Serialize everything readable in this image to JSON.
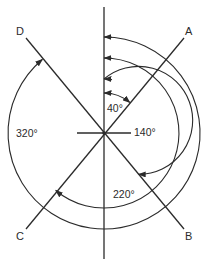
{
  "diagram": {
    "type": "bearing-angles",
    "center": {
      "x": 104,
      "y": 133
    },
    "lines": [
      {
        "label": "A",
        "angle_deg": 40
      },
      {
        "label": "B",
        "angle_deg": 140
      },
      {
        "label": "C",
        "angle_deg": 220
      },
      {
        "label": "D",
        "angle_deg": 320
      }
    ],
    "arcs": [
      {
        "label": "40°",
        "to": "A",
        "radius": 40
      },
      {
        "label": "140°",
        "to": "B",
        "radius": 54
      },
      {
        "label": "220°",
        "to": "C",
        "radius": 75
      },
      {
        "label": "320°",
        "to": "D",
        "radius": 96
      }
    ],
    "point_labels": {
      "a": "A",
      "b": "B",
      "c": "C",
      "d": "D"
    },
    "angle_labels": {
      "a40": "40°",
      "a140": "140°",
      "a220": "220°",
      "a320": "320°"
    },
    "colors": {
      "ink": "#2b2b2b",
      "background": "#ffffff"
    }
  }
}
